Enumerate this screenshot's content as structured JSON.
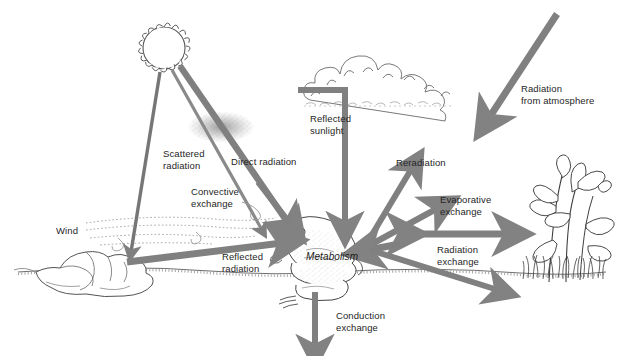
{
  "figure": {
    "background_color": "#ffffff",
    "arrow_color": "#808080",
    "arrow_color_dark": "#6e6e6e",
    "ink_color": "#4a4a4a",
    "text_color": "#262626",
    "width": 621,
    "height": 356
  },
  "labels": {
    "scattered_radiation": "Scattered\nradiation",
    "direct_radiation": "Direct radiation",
    "convective_exchange": "Convective\nexchange",
    "wind": "Wind",
    "reflected_radiation": "Reflected\nradiation",
    "reflected_sunlight": "Reflected\nsunlight",
    "radiation_from_atmosphere": "Radiation\nfrom atmosphere",
    "reradiation": "Reradiation",
    "evaporative_exchange": "Evaporative\nexchange",
    "radiation_exchange": "Radiation\nexchange",
    "conduction_exchange": "Conduction\nexchange",
    "metabolism": "Metabolism"
  },
  "objects": {
    "sun": "sun-icon",
    "cloud": "cloud-icon",
    "rock": "rock-icon",
    "frog": "frog-icon",
    "plant": "plant-icon",
    "ground": "ground-line",
    "scatter_cloud": "scattered-particles",
    "wind_streamlines": "wind-streamlines"
  },
  "flows": [
    {
      "name": "direct-radiation",
      "from": "sun",
      "to": "frog",
      "direction": "one-way"
    },
    {
      "name": "scattered-radiation",
      "from": "sun",
      "to": "rock",
      "direction": "one-way"
    },
    {
      "name": "reflected-sunlight",
      "from": "cloud",
      "to": "frog",
      "direction": "one-way"
    },
    {
      "name": "radiation-from-atmosphere",
      "from": "atmosphere",
      "to": "ground",
      "direction": "one-way"
    },
    {
      "name": "reflected-radiation",
      "from": "rock",
      "to": "frog",
      "direction": "one-way"
    },
    {
      "name": "convective-exchange",
      "from": "wind",
      "to": "frog",
      "direction": "one-way"
    },
    {
      "name": "reradiation",
      "from": "frog",
      "to": "sky",
      "direction": "one-way"
    },
    {
      "name": "evaporative-exchange",
      "from": "frog",
      "to": "air",
      "direction": "one-way"
    },
    {
      "name": "radiation-exchange",
      "from": "frog",
      "to": "plant",
      "direction": "two-way"
    },
    {
      "name": "conduction-exchange",
      "from": "frog",
      "to": "substrate",
      "direction": "one-way"
    },
    {
      "name": "ground-radiation",
      "from": "plant",
      "to": "frog",
      "direction": "one-way"
    }
  ]
}
